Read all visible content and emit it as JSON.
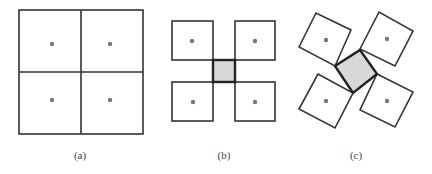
{
  "colors": {
    "stroke": "#333333",
    "fill_center": "#d8d8d8",
    "dot": "#777777",
    "background": "#ffffff"
  },
  "panels": [
    {
      "label": "(a)",
      "description": "2x2 grid of adjacent squares, each with a center dot",
      "squares": 4,
      "center_square": false
    },
    {
      "label": "(b)",
      "description": "Four squares separated, meeting a small gray square at center",
      "squares": 4,
      "center_square": true
    },
    {
      "label": "(c)",
      "description": "Four squares rotated around an enlarged rotated gray center square",
      "squares": 4,
      "center_square": true
    }
  ]
}
